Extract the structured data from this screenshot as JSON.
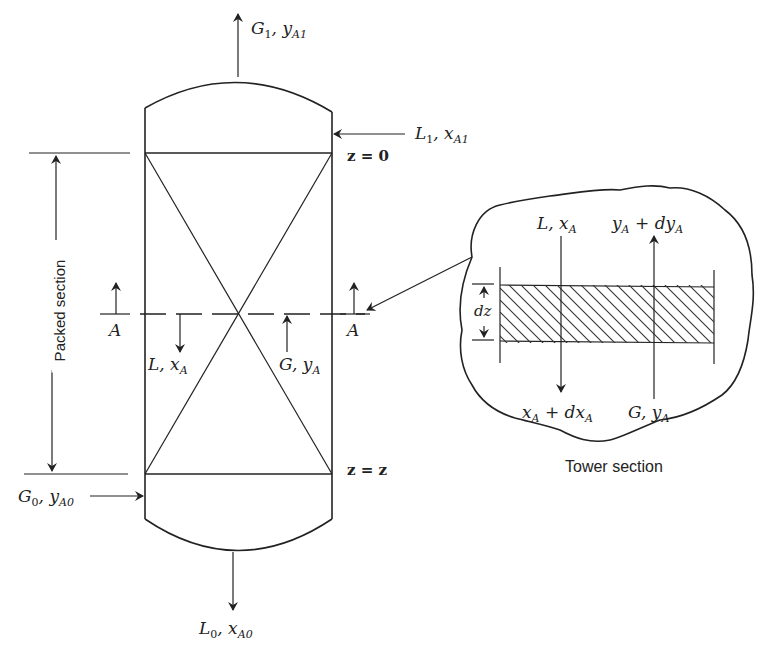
{
  "diagram": {
    "streams": {
      "gas_out": {
        "main": "G",
        "sub": "1",
        "comp": "y",
        "comp_sub": "A1"
      },
      "liquid_in": {
        "main": "L",
        "sub": "1",
        "comp": "x",
        "comp_sub": "A1"
      },
      "gas_in": {
        "main": "G",
        "sub": "0",
        "comp": "y",
        "comp_sub": "A0"
      },
      "liquid_out": {
        "main": "L",
        "sub": "0",
        "comp": "x",
        "comp_sub": "A0"
      },
      "liquid_local": {
        "main": "L",
        "comp": "x",
        "comp_sub": "A"
      },
      "gas_local": {
        "main": "G",
        "comp": "y",
        "comp_sub": "A"
      }
    },
    "positions": {
      "top": "z = 0",
      "bottom": "z = z"
    },
    "section_marker": "A",
    "packed_section_label": "Packed section",
    "tower_section": {
      "caption": "Tower section",
      "top_left": {
        "main": "L",
        "comp": "x",
        "comp_sub": "A"
      },
      "top_right": {
        "a": "y",
        "a_sub": "A",
        "op": "+",
        "b": "dy",
        "b_sub": "A"
      },
      "bottom_left": {
        "a": "x",
        "a_sub": "A",
        "op": "+",
        "b": "dx",
        "b_sub": "A"
      },
      "bottom_right": {
        "main": "G",
        "comp": "y",
        "comp_sub": "A"
      },
      "height_label": "dz"
    }
  }
}
